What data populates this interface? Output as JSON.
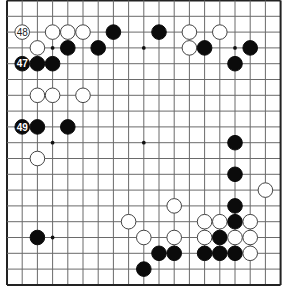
{
  "board": {
    "size": 19,
    "origin_x": 7,
    "origin_y": 0.5,
    "spacing_x": 15.2,
    "spacing_y": 15.8,
    "stone_radius": 7.3,
    "colors": {
      "line": "#6a6a6a",
      "edge": "#222222",
      "black": "#0b0b0b",
      "white": "#ffffff"
    },
    "star_points": [
      [
        3,
        3
      ],
      [
        9,
        3
      ],
      [
        15,
        3
      ],
      [
        3,
        9
      ],
      [
        9,
        9
      ],
      [
        15,
        9
      ],
      [
        3,
        15
      ],
      [
        9,
        15
      ],
      [
        15,
        15
      ]
    ],
    "stones": [
      {
        "color": "white",
        "col": 1,
        "row": 2,
        "label": "48"
      },
      {
        "color": "white",
        "col": 3,
        "row": 2
      },
      {
        "color": "white",
        "col": 4,
        "row": 2
      },
      {
        "color": "white",
        "col": 5,
        "row": 2
      },
      {
        "color": "black",
        "col": 7,
        "row": 2
      },
      {
        "color": "black",
        "col": 10,
        "row": 2
      },
      {
        "color": "white",
        "col": 12,
        "row": 2
      },
      {
        "color": "white",
        "col": 14,
        "row": 2
      },
      {
        "color": "white",
        "col": 2,
        "row": 3
      },
      {
        "color": "black",
        "col": 4,
        "row": 3
      },
      {
        "color": "black",
        "col": 6,
        "row": 3
      },
      {
        "color": "white",
        "col": 12,
        "row": 3
      },
      {
        "color": "black",
        "col": 13,
        "row": 3
      },
      {
        "color": "black",
        "col": 16,
        "row": 3
      },
      {
        "color": "black",
        "col": 1,
        "row": 4,
        "label": "47"
      },
      {
        "color": "black",
        "col": 2,
        "row": 4
      },
      {
        "color": "black",
        "col": 3,
        "row": 4
      },
      {
        "color": "black",
        "col": 15,
        "row": 4
      },
      {
        "color": "white",
        "col": 2,
        "row": 6
      },
      {
        "color": "white",
        "col": 3,
        "row": 6
      },
      {
        "color": "white",
        "col": 5,
        "row": 6
      },
      {
        "color": "black",
        "col": 1,
        "row": 8,
        "label": "49"
      },
      {
        "color": "black",
        "col": 2,
        "row": 8
      },
      {
        "color": "black",
        "col": 4,
        "row": 8
      },
      {
        "color": "black",
        "col": 15,
        "row": 9
      },
      {
        "color": "white",
        "col": 2,
        "row": 10
      },
      {
        "color": "black",
        "col": 15,
        "row": 11
      },
      {
        "color": "white",
        "col": 17,
        "row": 12
      },
      {
        "color": "white",
        "col": 11,
        "row": 13
      },
      {
        "color": "black",
        "col": 15,
        "row": 13
      },
      {
        "color": "white",
        "col": 8,
        "row": 14
      },
      {
        "color": "white",
        "col": 13,
        "row": 14
      },
      {
        "color": "white",
        "col": 14,
        "row": 14
      },
      {
        "color": "black",
        "col": 15,
        "row": 14
      },
      {
        "color": "white",
        "col": 16,
        "row": 14
      },
      {
        "color": "black",
        "col": 2,
        "row": 15
      },
      {
        "color": "white",
        "col": 9,
        "row": 15
      },
      {
        "color": "white",
        "col": 11,
        "row": 15
      },
      {
        "color": "white",
        "col": 13,
        "row": 15
      },
      {
        "color": "black",
        "col": 14,
        "row": 15
      },
      {
        "color": "white",
        "col": 15,
        "row": 15
      },
      {
        "color": "white",
        "col": 16,
        "row": 15
      },
      {
        "color": "black",
        "col": 10,
        "row": 16
      },
      {
        "color": "black",
        "col": 11,
        "row": 16
      },
      {
        "color": "black",
        "col": 13,
        "row": 16
      },
      {
        "color": "black",
        "col": 14,
        "row": 16
      },
      {
        "color": "black",
        "col": 15,
        "row": 16
      },
      {
        "color": "white",
        "col": 16,
        "row": 16
      },
      {
        "color": "black",
        "col": 9,
        "row": 17
      }
    ]
  }
}
